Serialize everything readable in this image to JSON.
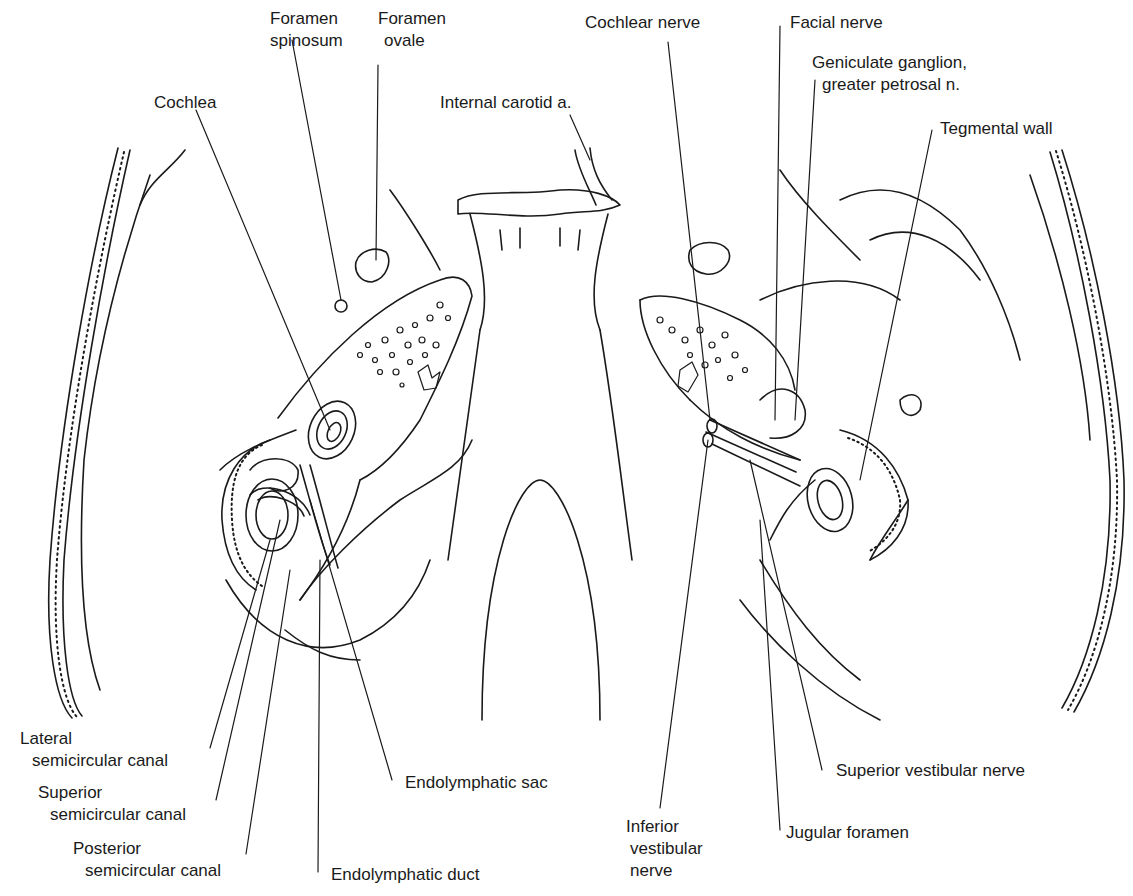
{
  "figure": {
    "type": "anatomical line drawing",
    "ink_color": "#1a1a1a",
    "background": "#ffffff"
  },
  "labels": {
    "foramen_spinosum": {
      "line1": "Foramen",
      "line2": "spinosum"
    },
    "foramen_ovale": {
      "line1": "Foramen",
      "line2": "ovale"
    },
    "cochlea": {
      "line1": "Cochlea"
    },
    "internal_carotid": {
      "line1": "Internal carotid a."
    },
    "cochlear_nerve": {
      "line1": "Cochlear nerve"
    },
    "facial_nerve": {
      "line1": "Facial nerve"
    },
    "geniculate": {
      "line1": "Geniculate ganglion,",
      "line2": "greater petrosal n."
    },
    "tegmental_wall": {
      "line1": "Tegmental wall"
    },
    "lateral_scc": {
      "line1": "Lateral",
      "line2": "semicircular canal"
    },
    "superior_scc": {
      "line1": "Superior",
      "line2": "semicircular canal"
    },
    "posterior_scc": {
      "line1": "Posterior",
      "line2": "semicircular canal"
    },
    "endolymphatic_sac": {
      "line1": "Endolymphatic sac"
    },
    "endolymphatic_duct": {
      "line1": "Endolymphatic duct"
    },
    "inferior_vestibular": {
      "line1": "Inferior",
      "line2": "vestibular",
      "line3": "nerve"
    },
    "jugular_foramen": {
      "line1": "Jugular foramen"
    },
    "superior_vestibular": {
      "line1": "Superior vestibular nerve"
    }
  }
}
